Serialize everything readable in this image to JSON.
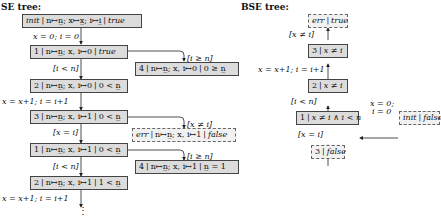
{
  "se_tree": {
    "title": "SE tree:",
    "nodes": [
      {
        "id": "init",
        "loc": "init",
        "store": "n↦n̲; x↦x̲; i↦i̲",
        "pc": "true"
      },
      {
        "id": "1a",
        "loc": "1",
        "store": "n↦n̲; x, i↦0",
        "pc": "true"
      },
      {
        "id": "4a",
        "loc": "4",
        "store": "n↦n̲; x, i↦0",
        "pc": "0 ≥ n̲"
      },
      {
        "id": "2a",
        "loc": "2",
        "store": "n↦n̲; x, i↦0",
        "pc": "0 < n̲"
      },
      {
        "id": "3a",
        "loc": "3",
        "store": "n↦n̲; x, i↦1",
        "pc": "0 < n̲"
      },
      {
        "id": "err",
        "loc": "err",
        "store": "n↦n̲; x, i↦1",
        "pc": "false"
      },
      {
        "id": "1b",
        "loc": "1",
        "store": "n↦n̲; x, i↦1",
        "pc": "0 < n̲"
      },
      {
        "id": "4b",
        "loc": "4",
        "store": "n↦n̲; x, i↦1",
        "pc": "n̲ = 1"
      },
      {
        "id": "2b",
        "loc": "2",
        "store": "n↦n̲; x, i↦1",
        "pc": "1 < n̲"
      }
    ],
    "edge_labels": {
      "init_1": "x = 0; i = 0",
      "1_4": "[i ≥ n]",
      "1_2": "[i < n]",
      "2_3": "x = x+1; i = i+1",
      "3_err": "[x ≠ i]",
      "3_1": "[x = i]",
      "1b_4b": "[i ≥ n]",
      "1b_2b": "[i < n]",
      "2b_next": "x = x+1; i = i+1"
    },
    "ellipsis": "⋮"
  },
  "bse_tree": {
    "title": "BSE tree:",
    "nodes": [
      {
        "id": "err",
        "loc": "err",
        "pc": "true"
      },
      {
        "id": "3",
        "loc": "3",
        "pc": "x ≠ i"
      },
      {
        "id": "2",
        "loc": "2",
        "pc": "x ≠ i"
      },
      {
        "id": "1",
        "loc": "1",
        "pc": "x ≠ i ∧ i < n"
      },
      {
        "id": "init",
        "loc": "init",
        "pc": "false"
      },
      {
        "id": "3f",
        "loc": "3",
        "pc": "false"
      }
    ],
    "edge_labels": {
      "err_3": "[x ≠ i]",
      "3_2": "x = x+1; i = i+1",
      "2_1": "[i < n]",
      "1_init_a": "x = 0;",
      "1_init_b": "i = 0",
      "1_3f": "[x = i]"
    }
  }
}
